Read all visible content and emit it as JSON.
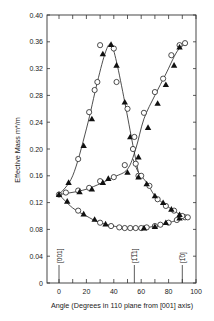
{
  "chart_data": {
    "type": "scatter",
    "title": "",
    "xlabel": "Angle (Degrees in 110 plane from [001] axis)",
    "ylabel": "Effective Mass m*/m",
    "xlim": [
      0,
      100
    ],
    "ylim": [
      0,
      0.4
    ],
    "x_ticks": [
      0,
      20,
      40,
      60,
      80,
      100
    ],
    "y_ticks": [
      0,
      0.04,
      0.08,
      0.12,
      0.16,
      0.2,
      0.24,
      0.28,
      0.32,
      0.36,
      0.4
    ],
    "y_tick_labels": [
      "0",
      "0.04",
      "0.08",
      "0.12",
      "0.16",
      "0.20",
      "0.24",
      "0.28",
      "0.32",
      "0.36",
      "0.40"
    ],
    "x_tick_labels": [
      "0",
      "20",
      "40",
      "60",
      "80",
      "100"
    ],
    "grid": false,
    "legend": null,
    "annotations": [
      {
        "text": "[001]",
        "x": 0
      },
      {
        "text": "[1̅1̅1]",
        "x": 55
      },
      {
        "text": "[1̅0]",
        "x": 90
      }
    ],
    "series": [
      {
        "name": "Branch A (peak at [111])",
        "marker": "open-circle",
        "curve": "fitted",
        "x": [
          0,
          14,
          22,
          26,
          28,
          30,
          40,
          42,
          50,
          54,
          58
        ],
        "y": [
          0.132,
          0.185,
          0.255,
          0.288,
          0.3,
          0.355,
          0.35,
          0.3,
          0.26,
          0.2,
          0.16
        ]
      },
      {
        "name": "Branch A triangles",
        "marker": "filled-triangle",
        "x": [
          0,
          7,
          18,
          24,
          32,
          38,
          42,
          48,
          52
        ],
        "y": [
          0.132,
          0.15,
          0.205,
          0.245,
          0.342,
          0.356,
          0.325,
          0.27,
          0.218
        ]
      },
      {
        "name": "Branch B (rising to [110])",
        "marker": "open-circle",
        "x": [
          5,
          14,
          22,
          30,
          40,
          48,
          55,
          62,
          70,
          76,
          82,
          88,
          92
        ],
        "y": [
          0.135,
          0.138,
          0.142,
          0.152,
          0.158,
          0.176,
          0.218,
          0.254,
          0.285,
          0.305,
          0.34,
          0.355,
          0.358
        ]
      },
      {
        "name": "Branch B triangles",
        "marker": "filled-triangle",
        "x": [
          15,
          24,
          32,
          36,
          50,
          58,
          65,
          72,
          78,
          84,
          88
        ],
        "y": [
          0.136,
          0.14,
          0.15,
          0.156,
          0.165,
          0.188,
          0.232,
          0.268,
          0.296,
          0.325,
          0.352
        ]
      },
      {
        "name": "Branch C (minimum near [111])",
        "marker": "open-circle",
        "x": [
          14,
          30,
          38,
          44,
          48,
          52,
          56,
          60,
          64,
          70,
          74,
          80,
          86,
          92
        ],
        "y": [
          0.108,
          0.09,
          0.085,
          0.083,
          0.082,
          0.082,
          0.082,
          0.082,
          0.083,
          0.085,
          0.087,
          0.09,
          0.094,
          0.098
        ]
      },
      {
        "name": "Branch C triangles",
        "marker": "filled-triangle",
        "x": [
          6,
          18,
          26,
          34,
          62,
          70,
          78,
          88
        ],
        "y": [
          0.122,
          0.103,
          0.095,
          0.088,
          0.082,
          0.084,
          0.09,
          0.097
        ]
      },
      {
        "name": "Branch D (falling from [111] to [110])",
        "marker": "open-circle",
        "x": [
          56,
          60,
          66,
          72,
          78,
          84,
          90,
          94
        ],
        "y": [
          0.178,
          0.16,
          0.145,
          0.125,
          0.115,
          0.108,
          0.1,
          0.098
        ]
      },
      {
        "name": "Branch D triangles",
        "marker": "filled-triangle",
        "x": [
          58,
          64,
          70,
          76,
          82,
          88
        ],
        "y": [
          0.158,
          0.148,
          0.13,
          0.12,
          0.11,
          0.102
        ]
      }
    ],
    "curves": [
      {
        "name": "A",
        "x": [
          0,
          10,
          20,
          28,
          34,
          38,
          42,
          48,
          54,
          58
        ],
        "y": [
          0.132,
          0.16,
          0.23,
          0.3,
          0.345,
          0.356,
          0.33,
          0.27,
          0.205,
          0.165
        ]
      },
      {
        "name": "B",
        "x": [
          0,
          20,
          40,
          50,
          56,
          62,
          70,
          78,
          86,
          92
        ],
        "y": [
          0.132,
          0.14,
          0.158,
          0.17,
          0.2,
          0.245,
          0.28,
          0.312,
          0.345,
          0.357
        ]
      },
      {
        "name": "C",
        "x": [
          0,
          10,
          20,
          30,
          45,
          55,
          65,
          75,
          85,
          92
        ],
        "y": [
          0.132,
          0.112,
          0.1,
          0.09,
          0.083,
          0.081,
          0.083,
          0.087,
          0.093,
          0.098
        ]
      },
      {
        "name": "D",
        "x": [
          54,
          58,
          64,
          70,
          78,
          86,
          92
        ],
        "y": [
          0.185,
          0.165,
          0.15,
          0.13,
          0.116,
          0.105,
          0.098
        ]
      }
    ]
  }
}
